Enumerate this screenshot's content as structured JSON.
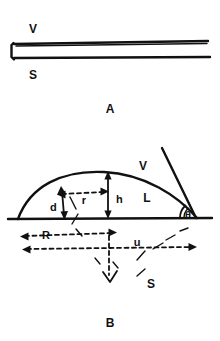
{
  "figure": {
    "title": "",
    "panels": [
      {
        "id": "A",
        "panel_label": "A",
        "description": "thin-film cross-section",
        "labels": [
          {
            "name": "vapor-label",
            "text": "V"
          },
          {
            "name": "substrate-label",
            "text": "S"
          }
        ]
      },
      {
        "id": "B",
        "panel_label": "B",
        "description": "spherical-cap droplet on substrate with contact angle",
        "labels": [
          {
            "name": "vapor-label",
            "text": "V"
          },
          {
            "name": "liquid-label",
            "text": "L"
          },
          {
            "name": "substrate-label",
            "text": "S"
          },
          {
            "name": "contact-angle-label",
            "text": "θ"
          },
          {
            "name": "height-label",
            "text": "h"
          },
          {
            "name": "radius-label",
            "text": "r"
          },
          {
            "name": "arc-position-label",
            "text": "z"
          },
          {
            "name": "sphere-radius-label",
            "text": "R"
          },
          {
            "name": "diameter-label",
            "text": "d"
          },
          {
            "name": "depth-label",
            "text": "u"
          }
        ]
      }
    ]
  },
  "colors": {
    "ink": "#111111",
    "background": "#ffffff"
  }
}
